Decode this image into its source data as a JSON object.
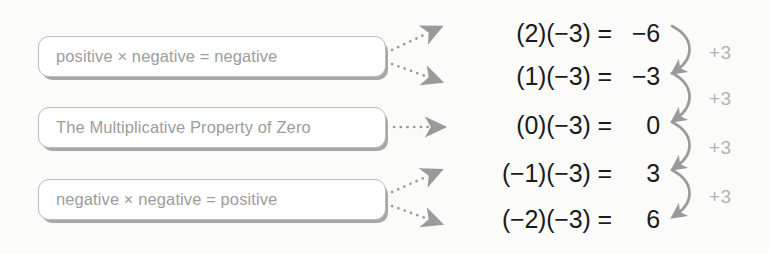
{
  "diagram": {
    "colors": {
      "background": "#fbfbfa",
      "box_border": "#bdbdbd",
      "box_shadow": "#a8a8a8",
      "box_text": "#9d9d9d",
      "equation_text": "#1b1b1b",
      "annotation_text": "#b3b3b3",
      "arrow": "#9a9a9a"
    },
    "rule_boxes": [
      {
        "label": "positive × negative = negative"
      },
      {
        "label": "The Multiplicative Property of Zero"
      },
      {
        "label": "negative × negative = positive"
      }
    ],
    "equations": [
      {
        "lhs": "(2)(−3)",
        "eq": "=",
        "rhs": "−6"
      },
      {
        "lhs": "(1)(−3)",
        "eq": "=",
        "rhs": "−3"
      },
      {
        "lhs": "(0)(−3)",
        "eq": "=",
        "rhs": "0"
      },
      {
        "lhs": "(−1)(−3)",
        "eq": "=",
        "rhs": "3"
      },
      {
        "lhs": "(−2)(−3)",
        "eq": "=",
        "rhs": "6"
      }
    ],
    "step_annotations": [
      {
        "label": "+3"
      },
      {
        "label": "+3"
      },
      {
        "label": "+3"
      },
      {
        "label": "+3"
      }
    ],
    "connector_arrows": [
      {
        "from_box": 0,
        "to_equation": 0,
        "style": "dotted"
      },
      {
        "from_box": 0,
        "to_equation": 1,
        "style": "dotted"
      },
      {
        "from_box": 1,
        "to_equation": 2,
        "style": "dotted"
      },
      {
        "from_box": 2,
        "to_equation": 3,
        "style": "dotted"
      },
      {
        "from_box": 2,
        "to_equation": 4,
        "style": "dotted"
      }
    ]
  }
}
